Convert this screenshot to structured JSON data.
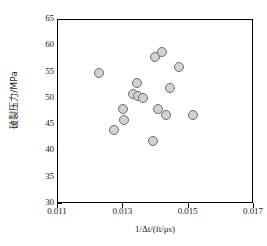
{
  "chart_data": {
    "type": "scatter",
    "title": "",
    "xlabel": "1/Δt/(ft/μs)",
    "ylabel": "破裂压力/MPa",
    "xlim": [
      0.011,
      0.017
    ],
    "ylim": [
      30,
      65
    ],
    "xticks": [
      "0.011",
      "0.013",
      "0.015",
      "0.017"
    ],
    "xtick_values": [
      0.011,
      0.013,
      0.015,
      0.017
    ],
    "yticks": [
      "30",
      "35",
      "40",
      "45",
      "50",
      "55",
      "60",
      "65"
    ],
    "ytick_values": [
      30,
      35,
      40,
      45,
      50,
      55,
      60,
      65
    ],
    "grid": false,
    "legend": null,
    "marker": {
      "shape": "circle",
      "fill": "#d2d2d2",
      "edge": "#6d6d6d",
      "size_px": 10
    },
    "series": [
      {
        "name": "破裂压力",
        "points": [
          {
            "x": 0.01225,
            "y": 55.0
          },
          {
            "x": 0.013,
            "y": 48.0
          },
          {
            "x": 0.01302,
            "y": 46.0
          },
          {
            "x": 0.01272,
            "y": 44.0
          },
          {
            "x": 0.01343,
            "y": 53.0
          },
          {
            "x": 0.0133,
            "y": 50.9
          },
          {
            "x": 0.01345,
            "y": 50.6
          },
          {
            "x": 0.0136,
            "y": 50.1
          },
          {
            "x": 0.0139,
            "y": 42.0
          },
          {
            "x": 0.01398,
            "y": 58.0
          },
          {
            "x": 0.01418,
            "y": 59.0
          },
          {
            "x": 0.01405,
            "y": 48.0
          },
          {
            "x": 0.01432,
            "y": 47.0
          },
          {
            "x": 0.01443,
            "y": 52.0
          },
          {
            "x": 0.0147,
            "y": 56.0
          },
          {
            "x": 0.01513,
            "y": 47.0
          }
        ]
      }
    ]
  },
  "axes": {
    "x": {
      "label": "1/Δt/(ft/μs)",
      "ticks": [
        "0.011",
        "0.013",
        "0.015",
        "0.017"
      ]
    },
    "y": {
      "label": "破裂压力/MPa",
      "ticks": [
        "65",
        "60",
        "55",
        "50",
        "45",
        "40",
        "35",
        "30"
      ]
    }
  }
}
